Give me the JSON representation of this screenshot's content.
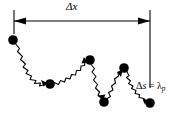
{
  "figure": {
    "type": "diagram",
    "background_color": "#ffffff",
    "ink_color": "#000000",
    "width": 185,
    "height": 119,
    "labels": {
      "extension": {
        "delta": "Δ",
        "variable": "x",
        "full": "Δx",
        "name": "delta-x-label"
      },
      "segment": {
        "delta": "Δ",
        "variable": "s",
        "equals": "=",
        "lambda": "λ",
        "subscript": "p",
        "full": "Δs = λₚ",
        "name": "delta-s-label"
      }
    },
    "dimension_arrow": {
      "name": "delta-x-dimension-arrow",
      "y": 21,
      "x_start": 14,
      "x_end": 150,
      "left_tick_top": 10,
      "left_tick_bottom": 34,
      "right_tick_top": 10,
      "right_tick_bottom": 88,
      "arrowheads": "both"
    },
    "chain": {
      "name": "polymer-chain-path",
      "stroke_width": 1.1,
      "node_radius": 4.6,
      "nodes": [
        {
          "id": "node-1",
          "x": 13,
          "y": 40
        },
        {
          "id": "node-2",
          "x": 50,
          "y": 84
        },
        {
          "id": "node-3",
          "x": 90,
          "y": 60
        },
        {
          "id": "node-4",
          "x": 104,
          "y": 102
        },
        {
          "id": "node-5",
          "x": 124,
          "y": 68
        },
        {
          "id": "node-6",
          "x": 150,
          "y": 103
        }
      ],
      "segments": [
        {
          "from": "node-1",
          "to": "node-2",
          "style": "zigzag"
        },
        {
          "from": "node-2",
          "to": "node-3",
          "style": "zigzag"
        },
        {
          "from": "node-3",
          "to": "node-4",
          "style": "zigzag"
        },
        {
          "from": "node-4",
          "to": "node-5",
          "style": "zigzag"
        },
        {
          "from": "node-5",
          "to": "node-6",
          "style": "zigzag"
        }
      ]
    }
  }
}
